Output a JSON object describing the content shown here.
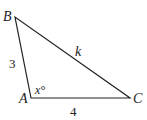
{
  "diagram": {
    "type": "triangle",
    "vertices": {
      "A": {
        "label": "A",
        "x": 31,
        "y": 98
      },
      "B": {
        "label": "B",
        "x": 15,
        "y": 17
      },
      "C": {
        "label": "C",
        "x": 130,
        "y": 98
      }
    },
    "sides": {
      "AB": {
        "label": "3"
      },
      "AC": {
        "label": "4"
      },
      "BC": {
        "label": "k"
      }
    },
    "angle_A": {
      "label": "x°"
    },
    "stroke_color": "#222222"
  }
}
